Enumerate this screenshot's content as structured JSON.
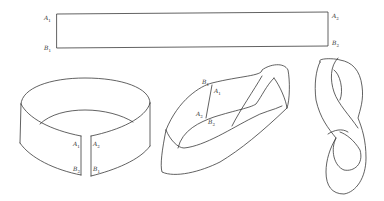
{
  "figure": {
    "stroke_color": "#3a3a3a",
    "background": "#ffffff"
  },
  "rectangle": {
    "labels": {
      "top_left": {
        "letter": "A",
        "sub": "1"
      },
      "bottom_left": {
        "letter": "B",
        "sub": "1"
      },
      "top_right": {
        "letter": "A",
        "sub": "2"
      },
      "bottom_right": {
        "letter": "B",
        "sub": "2"
      }
    }
  },
  "ring": {
    "labels": {
      "left_top": {
        "letter": "A",
        "sub": "1"
      },
      "left_bottom": {
        "letter": "B",
        "sub": "2"
      },
      "right_top": {
        "letter": "A",
        "sub": "2"
      },
      "right_bottom": {
        "letter": "B",
        "sub": "1"
      }
    }
  },
  "twisted": {
    "labels": {
      "b1": {
        "letter": "B",
        "sub": "1"
      },
      "a1": {
        "letter": "A",
        "sub": "1"
      },
      "a2": {
        "letter": "A",
        "sub": "2"
      },
      "b2": {
        "letter": "B",
        "sub": "2"
      }
    }
  },
  "mobius": {}
}
